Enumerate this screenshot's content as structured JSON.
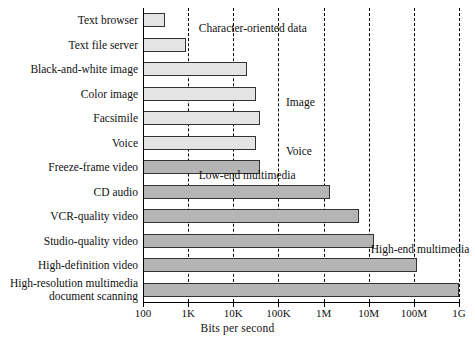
{
  "chart_data": {
    "type": "bar",
    "title": "",
    "xlabel": "Bits per second",
    "ylabel": "",
    "orientation": "horizontal",
    "xscale": "log",
    "xlim": [
      100,
      1000000000
    ],
    "grid": true,
    "legend": "none",
    "tick_labels": [
      "100",
      "1K",
      "10K",
      "100K",
      "1M",
      "10M",
      "100M",
      "1G"
    ],
    "tick_values": [
      100,
      1000,
      10000,
      100000,
      1000000,
      10000000,
      100000000,
      1000000000
    ],
    "categories": [
      "Text browser",
      "Text file server",
      "Black-and-white image",
      "Color image",
      "Facsimile",
      "Voice",
      "Freeze-frame video",
      "CD audio",
      "VCR-quality video",
      "Studio-quality video",
      "High-definition video",
      "High-resolution multimedia\ndocument scanning"
    ],
    "values": [
      300,
      900,
      20000,
      32000,
      40000,
      32000,
      40000,
      1400000,
      6000000,
      13000000,
      120000000,
      1000000000
    ],
    "value_labels": [
      "300",
      "900",
      "20K",
      "32K",
      "40K",
      "32K",
      "40K",
      "1.4M",
      "6M",
      "13M",
      "120M",
      "1G"
    ],
    "bar_shades": [
      "light",
      "light",
      "light",
      "light",
      "light",
      "light",
      "dark",
      "dark",
      "dark",
      "dark",
      "dark",
      "dark"
    ],
    "annotations": [
      {
        "text": "Character-oriented data",
        "x": 1400,
        "row": 0
      },
      {
        "text": "Image",
        "x": 120000,
        "row": 3
      },
      {
        "text": "Voice",
        "x": 120000,
        "row": 5
      },
      {
        "text": "Low-end multimedia",
        "x": 1400,
        "row": 6
      },
      {
        "text": "High-end multimedia",
        "x": 9000000,
        "row": 9
      }
    ],
    "colors": {
      "bar_light": "#e4e4e4",
      "bar_dark": "#b5b5b5",
      "bar_edge": "#333333",
      "axis": "#000000",
      "grid": "#000000",
      "background": "#ffffff"
    }
  }
}
